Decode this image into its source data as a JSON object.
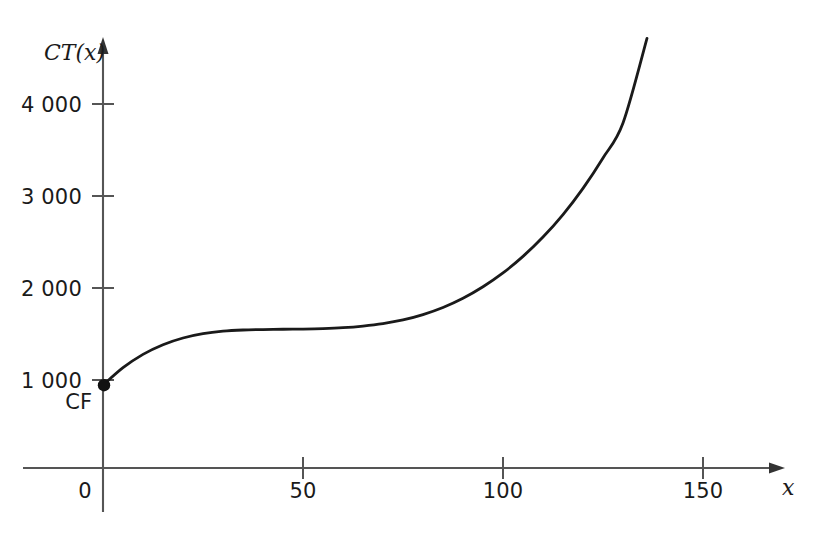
{
  "chart_data": {
    "type": "line",
    "title": "",
    "subtitle": "",
    "xlabel": "x",
    "ylabel": "CT(x)",
    "xlim": [
      -20,
      170
    ],
    "ylim": [
      0,
      4800
    ],
    "grid": false,
    "legend": null,
    "x_ticks": [
      {
        "value": 0,
        "label": "0"
      },
      {
        "value": 50,
        "label": "50"
      },
      {
        "value": 100,
        "label": "100"
      },
      {
        "value": 150,
        "label": "150"
      }
    ],
    "y_ticks": [
      {
        "value": 1000,
        "label": "1 000"
      },
      {
        "value": 2000,
        "label": "2 000"
      },
      {
        "value": 3000,
        "label": "3 000"
      },
      {
        "value": 4000,
        "label": "4 000"
      }
    ],
    "series": [
      {
        "name": "CT(x)",
        "color": "#1a1a1a",
        "x": [
          0,
          5,
          10,
          15,
          20,
          25,
          30,
          35,
          40,
          45,
          50,
          55,
          60,
          65,
          70,
          75,
          80,
          85,
          90,
          95,
          100,
          105,
          110,
          115,
          120,
          125,
          130,
          136
        ],
        "y": [
          900,
          1090,
          1235,
          1340,
          1413,
          1460,
          1487,
          1500,
          1505,
          1508,
          1510,
          1515,
          1525,
          1543,
          1570,
          1610,
          1668,
          1745,
          1845,
          1970,
          2120,
          2300,
          2510,
          2755,
          3040,
          3370,
          3750,
          4670
        ]
      }
    ],
    "annotations": [
      {
        "name": "fixed-cost-point",
        "label": "CF",
        "x": 0,
        "y": 900,
        "marker": "filled-circle"
      }
    ]
  },
  "axis_labels": {
    "y_axis_name": "CT(x)",
    "x_axis_name": "x",
    "origin": "0"
  },
  "tick_labels": {
    "y": [
      "1 000",
      "2 000",
      "3 000",
      "4 000"
    ],
    "x": [
      "50",
      "100",
      "150"
    ]
  },
  "annotation_labels": {
    "fixed_cost": "CF"
  },
  "colors": {
    "curve": "#1a1a1a",
    "axis": "#4a4a4a",
    "text": "#1a1a1a",
    "background": "#ffffff"
  }
}
